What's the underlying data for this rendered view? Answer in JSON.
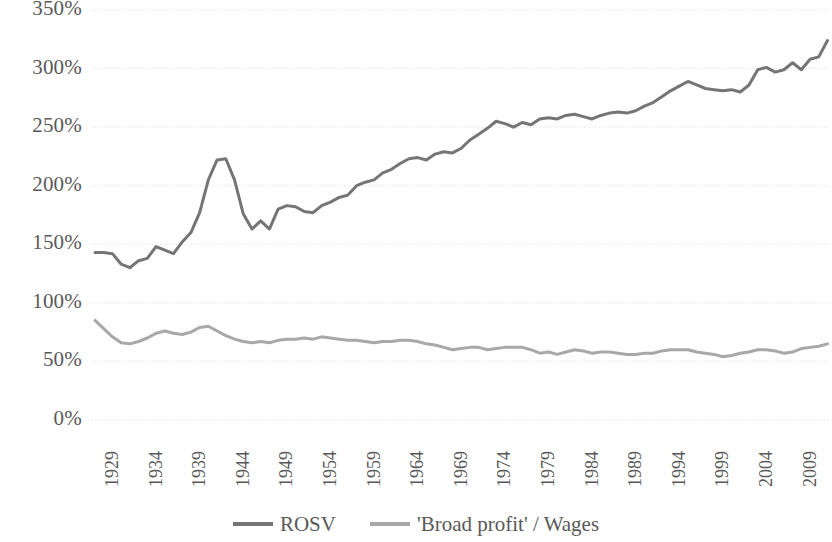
{
  "chart_data": {
    "type": "line",
    "title": "",
    "subtitle": "",
    "xlabel": "",
    "ylabel": "",
    "xlim": [
      1929,
      2013
    ],
    "ylim": [
      0,
      350
    ],
    "grid": true,
    "grid_axis": "y",
    "legend_position": "bottom",
    "y_ticks": [
      0,
      50,
      100,
      150,
      200,
      250,
      300,
      350
    ],
    "y_tick_labels": [
      "0%",
      "50%",
      "100%",
      "150%",
      "200%",
      "250%",
      "300%",
      "350%"
    ],
    "x_ticks": [
      1929,
      1934,
      1939,
      1944,
      1949,
      1954,
      1959,
      1964,
      1969,
      1974,
      1979,
      1984,
      1989,
      1994,
      1999,
      2004,
      2009
    ],
    "x_tick_labels": [
      "1929",
      "1934",
      "1939",
      "1944",
      "1949",
      "1954",
      "1959",
      "1964",
      "1969",
      "1974",
      "1979",
      "1984",
      "1989",
      "1994",
      "1999",
      "2004",
      "2009"
    ],
    "x": [
      1929,
      1930,
      1931,
      1932,
      1933,
      1934,
      1935,
      1936,
      1937,
      1938,
      1939,
      1940,
      1941,
      1942,
      1943,
      1944,
      1945,
      1946,
      1947,
      1948,
      1949,
      1950,
      1951,
      1952,
      1953,
      1954,
      1955,
      1956,
      1957,
      1958,
      1959,
      1960,
      1961,
      1962,
      1963,
      1964,
      1965,
      1966,
      1967,
      1968,
      1969,
      1970,
      1971,
      1972,
      1973,
      1974,
      1975,
      1976,
      1977,
      1978,
      1979,
      1980,
      1981,
      1982,
      1983,
      1984,
      1985,
      1986,
      1987,
      1988,
      1989,
      1990,
      1991,
      1992,
      1993,
      1994,
      1995,
      1996,
      1997,
      1998,
      1999,
      2000,
      2001,
      2002,
      2003,
      2004,
      2005,
      2006,
      2007,
      2008,
      2009,
      2010,
      2011,
      2012,
      2013
    ],
    "series": [
      {
        "name": "ROSV",
        "color": "#757575",
        "linewidth": 3,
        "values": [
          143,
          143,
          142,
          133,
          130,
          136,
          138,
          148,
          145,
          142,
          152,
          160,
          177,
          205,
          222,
          223,
          205,
          176,
          163,
          170,
          163,
          180,
          183,
          182,
          178,
          177,
          183,
          186,
          190,
          192,
          200,
          203,
          205,
          211,
          214,
          219,
          223,
          224,
          222,
          227,
          229,
          228,
          232,
          239,
          244,
          249,
          255,
          253,
          250,
          254,
          252,
          257,
          258,
          257,
          260,
          261,
          259,
          257,
          260,
          262,
          263,
          262,
          264,
          268,
          271,
          276,
          281,
          285,
          289,
          286,
          283,
          282,
          281,
          282,
          280,
          286,
          299,
          301,
          297,
          299,
          305,
          299,
          308,
          310,
          324
        ]
      },
      {
        "name": "'Broad profit' / Wages",
        "color": "#a8a8a8",
        "linewidth": 3,
        "values": [
          85,
          78,
          71,
          66,
          65,
          67,
          70,
          74,
          76,
          74,
          73,
          75,
          79,
          80,
          76,
          72,
          69,
          67,
          66,
          67,
          66,
          68,
          69,
          69,
          70,
          69,
          71,
          70,
          69,
          68,
          68,
          67,
          66,
          67,
          67,
          68,
          68,
          67,
          65,
          64,
          62,
          60,
          61,
          62,
          62,
          60,
          61,
          62,
          62,
          62,
          60,
          57,
          58,
          56,
          58,
          60,
          59,
          57,
          58,
          58,
          57,
          56,
          56,
          57,
          57,
          59,
          60,
          60,
          60,
          58,
          57,
          56,
          54,
          55,
          57,
          58,
          60,
          60,
          59,
          57,
          58,
          61,
          62,
          63,
          65
        ]
      }
    ]
  },
  "legend": {
    "items": [
      {
        "label": "ROSV",
        "color": "#757575"
      },
      {
        "label": "'Broad profit' / Wages",
        "color": "#a8a8a8"
      }
    ]
  },
  "axes": {
    "grid_color": "#dedede",
    "tick_label_color": "#595959"
  }
}
